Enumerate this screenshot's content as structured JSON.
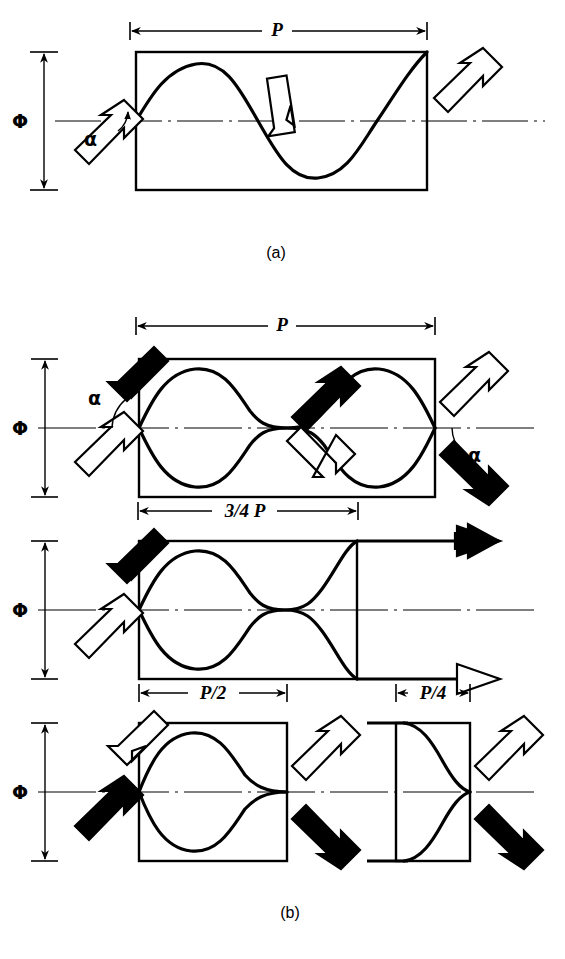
{
  "figure": {
    "type": "technical-diagram",
    "background_color": "#ffffff",
    "stroke_color": "#000000",
    "fill_dark": "#000000",
    "fill_light": "#ffffff"
  },
  "captions": {
    "panel_a": "(a)",
    "panel_b": "(b)"
  },
  "panel_a": {
    "name": "single-helix-diagram",
    "pitch_label": "P",
    "diameter_label": "Φ",
    "angle_label": "α",
    "arrows": [
      {
        "name": "entry-arrow",
        "fill": "light",
        "direction": "up-right"
      },
      {
        "name": "mid-arrow",
        "fill": "light",
        "direction": "down-right"
      },
      {
        "name": "exit-arrow",
        "fill": "light",
        "direction": "up-right"
      }
    ]
  },
  "panel_b": {
    "name": "braid-pattern-diagrams",
    "rows": [
      {
        "name": "row-full-pitch",
        "pitch_label": "P",
        "diameter_label": "Φ",
        "angle_label_left": "α",
        "angle_label_right": "α",
        "arrows": [
          {
            "name": "entry-arrow-dark",
            "fill": "dark",
            "direction": "down-right"
          },
          {
            "name": "entry-arrow-light",
            "fill": "light",
            "direction": "up-right"
          },
          {
            "name": "mid-arrow-dark",
            "fill": "dark",
            "direction": "up-right"
          },
          {
            "name": "mid-arrow-light",
            "fill": "light",
            "direction": "down-right"
          },
          {
            "name": "exit-arrow-light",
            "fill": "light",
            "direction": "up-right"
          },
          {
            "name": "exit-arrow-dark",
            "fill": "dark",
            "direction": "down-right"
          }
        ]
      },
      {
        "name": "row-three-quarter-pitch",
        "pitch_label": "3/4 P",
        "diameter_label": "Φ",
        "arrows": [
          {
            "name": "entry-arrow-dark",
            "fill": "dark",
            "direction": "down-right"
          },
          {
            "name": "entry-arrow-light",
            "fill": "light",
            "direction": "up-right"
          },
          {
            "name": "exit-arrow-dark",
            "fill": "dark",
            "direction": "right"
          },
          {
            "name": "exit-arrow-light",
            "fill": "light",
            "direction": "right"
          }
        ]
      },
      {
        "name": "row-half-and-quarter-pitch",
        "diameter_label": "Φ",
        "boxes": [
          {
            "name": "half-pitch-box",
            "pitch_label": "P/2",
            "arrows": [
              {
                "name": "entry-arrow-light",
                "fill": "light",
                "direction": "down-right"
              },
              {
                "name": "entry-arrow-dark",
                "fill": "dark",
                "direction": "up-right"
              },
              {
                "name": "exit-arrow-light",
                "fill": "light",
                "direction": "up-right"
              },
              {
                "name": "exit-arrow-dark",
                "fill": "dark",
                "direction": "down-right"
              }
            ]
          },
          {
            "name": "quarter-pitch-box",
            "pitch_label": "P/4",
            "arrows": [
              {
                "name": "exit-arrow-light",
                "fill": "light",
                "direction": "up-right"
              },
              {
                "name": "exit-arrow-dark",
                "fill": "dark",
                "direction": "down-right"
              }
            ]
          }
        ]
      }
    ]
  }
}
